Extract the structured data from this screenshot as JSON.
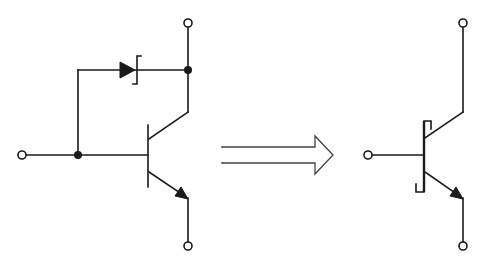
{
  "diagram": {
    "title": "",
    "colors": {
      "stroke": "#1a1a1a",
      "background": "#ffffff",
      "arrow": "#444444"
    },
    "left_circuit": {
      "name": "npn-transistor-with-schottky-clamp-diode",
      "components": [
        "npn-transistor",
        "schottky-diode"
      ],
      "terminals": [
        "base",
        "collector",
        "emitter"
      ]
    },
    "transformation_arrow": {
      "direction": "right",
      "style": "hollow-double-line"
    },
    "right_circuit": {
      "name": "schottky-transistor-symbol",
      "components": [
        "schottky-npn-transistor"
      ],
      "terminals": [
        "base",
        "collector",
        "emitter"
      ]
    }
  }
}
